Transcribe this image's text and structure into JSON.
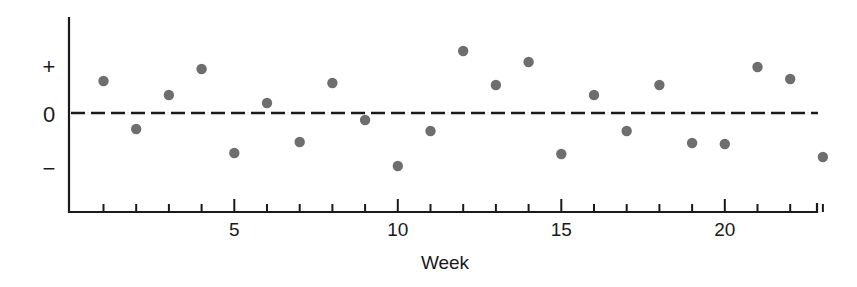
{
  "chart_data": {
    "type": "scatter",
    "title": "",
    "xlabel": "Week",
    "ylabel": "",
    "x": [
      1,
      2,
      3,
      4,
      5,
      6,
      7,
      8,
      9,
      10,
      11,
      12,
      13,
      14,
      15,
      16,
      17,
      18,
      19,
      20,
      21,
      22,
      23
    ],
    "values": [
      0.64,
      -0.32,
      0.36,
      0.88,
      -0.8,
      0.2,
      -0.58,
      0.6,
      -0.14,
      -1.06,
      -0.36,
      1.24,
      0.56,
      1.02,
      -0.82,
      0.36,
      -0.36,
      0.56,
      -0.6,
      -0.62,
      0.92,
      0.68,
      -0.88
    ],
    "xlim": [
      0,
      23
    ],
    "ylim": [
      -2,
      1.9
    ],
    "x_ticks": [
      1,
      2,
      3,
      4,
      5,
      6,
      7,
      8,
      9,
      10,
      11,
      12,
      13,
      14,
      15,
      16,
      17,
      18,
      19,
      20,
      21,
      22,
      23
    ],
    "x_tick_labels": [
      {
        "value": 5,
        "label": "5"
      },
      {
        "value": 10,
        "label": "10"
      },
      {
        "value": 15,
        "label": "15"
      },
      {
        "value": 20,
        "label": "20"
      }
    ],
    "y_tick_labels": [
      {
        "value": 1,
        "label": "+"
      },
      {
        "value": 0,
        "label": "0"
      },
      {
        "value": -1,
        "label": "−"
      }
    ],
    "reference_line": {
      "value": 0,
      "style": "dashed"
    },
    "grid": false,
    "legend": null,
    "point_color": "#6e6e6e",
    "axis_color": "#1a1a1a"
  }
}
